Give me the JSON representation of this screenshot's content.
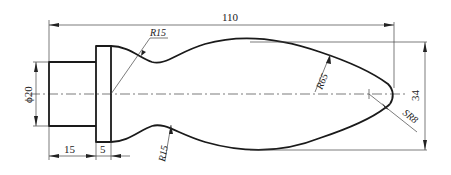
{
  "drawing": {
    "type": "mechanical part drawing (handle)",
    "dimensions": {
      "overall_length": "110",
      "overall_height": "34",
      "shank_diameter": "ϕ20",
      "shank_length": "15",
      "collar_width": "5",
      "neck_radius_top": "R15",
      "neck_radius_bottom": "R15",
      "body_radius": "R65",
      "end_sphere_radius": "SR8"
    }
  }
}
